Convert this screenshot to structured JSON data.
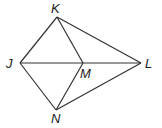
{
  "diagram": {
    "type": "geometry",
    "points": {
      "K": {
        "label": "K",
        "x": 57,
        "y": 17
      },
      "J": {
        "label": "J",
        "x": 20,
        "y": 63
      },
      "M": {
        "label": "M",
        "x": 83,
        "y": 63
      },
      "L": {
        "label": "L",
        "x": 141,
        "y": 63
      },
      "N": {
        "label": "N",
        "x": 56,
        "y": 110
      }
    },
    "segments": [
      "KJ",
      "KL",
      "KM",
      "JL",
      "JN",
      "NM",
      "NL"
    ],
    "line_color": "#333333"
  }
}
